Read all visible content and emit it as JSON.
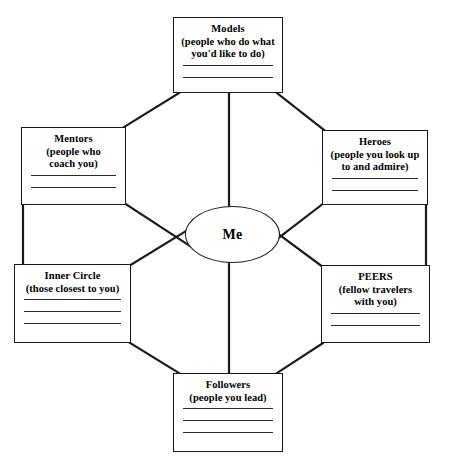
{
  "diagram": {
    "center": {
      "label": "Me",
      "shape": "ellipse"
    },
    "nodes": [
      {
        "id": "models",
        "title": "Models",
        "subtitle": "(people who do what you'd like to do)",
        "subtitle_lines": [
          "(people who do what",
          "you'd like to do)"
        ],
        "blank_lines": 2,
        "box": {
          "x": 173,
          "y": 17,
          "w": 110,
          "h": 76
        }
      },
      {
        "id": "mentors",
        "title": "Mentors",
        "subtitle": "(people who coach you)",
        "subtitle_lines": [
          "(people who",
          "coach you)"
        ],
        "blank_lines": 2,
        "box": {
          "x": 21,
          "y": 127,
          "w": 105,
          "h": 78
        }
      },
      {
        "id": "heroes",
        "title": "Heroes",
        "subtitle": "(people you look up to and admire)",
        "subtitle_lines": [
          "(people you look up",
          "to and admire)"
        ],
        "blank_lines": 2,
        "box": {
          "x": 322,
          "y": 130,
          "w": 106,
          "h": 75
        }
      },
      {
        "id": "inner-circle",
        "title": "Inner Circle",
        "subtitle": "(those closest to you)",
        "subtitle_lines": [
          "(those closest to you)"
        ],
        "blank_lines": 3,
        "box": {
          "x": 14,
          "y": 264,
          "w": 117,
          "h": 79
        }
      },
      {
        "id": "peers",
        "title": "PEERS",
        "subtitle": "(fellow travelers with you)",
        "subtitle_lines": [
          "(fellow travelers",
          "with you)"
        ],
        "blank_lines": 2,
        "box": {
          "x": 321,
          "y": 265,
          "w": 109,
          "h": 78
        }
      },
      {
        "id": "followers",
        "title": "Followers",
        "subtitle": "(people you lead)",
        "subtitle_lines": [
          "(people you lead)"
        ],
        "blank_lines": 3,
        "box": {
          "x": 173,
          "y": 373,
          "w": 110,
          "h": 79
        }
      }
    ],
    "colors": {
      "stroke": "#1a1a1a",
      "blank_rule": "#2b2b2b",
      "background": "#ffffff",
      "text": "#000000"
    }
  }
}
